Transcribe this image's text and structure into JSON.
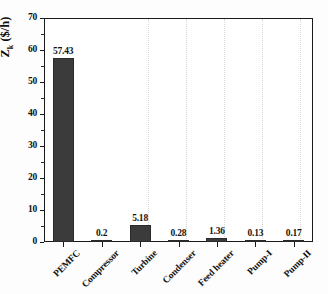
{
  "chart_data": {
    "type": "bar",
    "title": "",
    "xlabel": "",
    "ylabel": "Żk ($/h)",
    "ylabel_parts": {
      "symbol": "Z",
      "subscript": "k",
      "units": "($/h)"
    },
    "categories": [
      "PEMFC",
      "Compressor",
      "Turbine",
      "Condenser",
      "Feed heater",
      "Pump-I",
      "Pump-II"
    ],
    "values": [
      57.43,
      0.2,
      5.18,
      0.28,
      1.36,
      0.13,
      0.17
    ],
    "value_labels": [
      "57.43",
      "0.2",
      "5.18",
      "0.28",
      "1.36",
      "0.13",
      "0.17"
    ],
    "ylim": [
      0,
      70
    ],
    "ytick_labels": [
      "0",
      "10",
      "20",
      "30",
      "40",
      "50",
      "60",
      "70"
    ],
    "ytick_values": [
      0,
      10,
      20,
      30,
      40,
      50,
      60,
      70
    ],
    "grid": "vertical-dotted",
    "legend": "none",
    "bar_color": "#3b3b3b",
    "axis_color": "#1a1a1a",
    "grid_color": "#d8d8d8",
    "background_color": "#ffffff"
  }
}
